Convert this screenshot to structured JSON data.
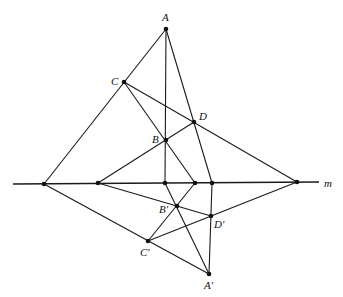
{
  "diagram": {
    "type": "projective-geometry-construction",
    "line_label": "m",
    "axis": {
      "x1": 13,
      "y1": 184,
      "x2": 319,
      "y2": 182
    },
    "points": {
      "A": {
        "label": "A",
        "x": 166,
        "y": 29,
        "lx": 162,
        "ly": 21
      },
      "C": {
        "label": "C",
        "x": 124,
        "y": 82,
        "lx": 111,
        "ly": 85
      },
      "D": {
        "label": "D",
        "x": 194,
        "y": 122,
        "lx": 199,
        "ly": 120
      },
      "B": {
        "label": "B",
        "x": 166,
        "y": 140,
        "lx": 152,
        "ly": 143
      },
      "M1": {
        "label": "",
        "x": 44,
        "y": 184
      },
      "M2": {
        "label": "",
        "x": 98,
        "y": 183
      },
      "M3": {
        "label": "",
        "x": 165,
        "y": 183
      },
      "M4": {
        "label": "",
        "x": 195,
        "y": 183
      },
      "M5": {
        "label": "",
        "x": 212,
        "y": 183
      },
      "M6": {
        "label": "",
        "x": 297,
        "y": 182
      },
      "Bp": {
        "label": "B′",
        "x": 177,
        "y": 206,
        "lx": 159,
        "ly": 213
      },
      "Dp": {
        "label": "D′",
        "x": 211,
        "y": 216,
        "lx": 214,
        "ly": 228
      },
      "Cp": {
        "label": "C′",
        "x": 148,
        "y": 241,
        "lx": 140,
        "ly": 256
      },
      "Ap": {
        "label": "A′",
        "x": 209,
        "y": 274,
        "lx": 204,
        "ly": 289
      }
    },
    "segments": [
      [
        "A",
        "M1"
      ],
      [
        "A",
        "M3"
      ],
      [
        "A",
        "M5"
      ],
      [
        "C",
        "M4"
      ],
      [
        "C",
        "M6"
      ],
      [
        "M2",
        "D"
      ],
      [
        "M1",
        "Ap"
      ],
      [
        "M2",
        "Dp"
      ],
      [
        "M3",
        "Ap"
      ],
      [
        "M4",
        "Cp"
      ],
      [
        "Cp",
        "M6"
      ],
      [
        "M5",
        "Ap"
      ]
    ]
  }
}
